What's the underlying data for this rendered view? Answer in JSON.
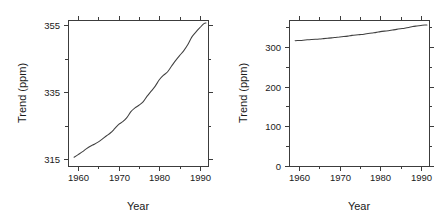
{
  "figure": {
    "title": "",
    "background": "#ffffff",
    "line_color": "#404040",
    "axis_color": "#3c3c3c",
    "panel_count": 2
  },
  "chart_data": [
    {
      "type": "line",
      "panel": "left",
      "title": "",
      "xlabel": "Year",
      "ylabel": "Trend (ppm)",
      "xlim": [
        1957.5,
        1992.0
      ],
      "ylim": [
        313.0,
        356.5
      ],
      "grid": false,
      "legend": null,
      "xticks": [
        1960,
        1970,
        1980,
        1990
      ],
      "xticklabels": [
        "1960",
        "1970",
        "1980",
        "1990"
      ],
      "xminorticks": [
        1965,
        1975,
        1985
      ],
      "yticks": [
        315,
        335,
        355
      ],
      "yticklabels": [
        "315",
        "335",
        "355"
      ],
      "yminorticks": [
        325,
        345
      ],
      "frame": "box",
      "tick_direction": "out",
      "series": [
        {
          "name": "CO2 trend",
          "x": [
            1959.0,
            1960.0,
            1961.0,
            1962.0,
            1963.0,
            1964.0,
            1965.0,
            1966.0,
            1967.0,
            1968.0,
            1969.0,
            1970.0,
            1971.0,
            1972.0,
            1973.0,
            1974.0,
            1975.0,
            1976.0,
            1977.0,
            1978.0,
            1979.0,
            1980.0,
            1981.0,
            1982.0,
            1983.0,
            1984.0,
            1985.0,
            1986.0,
            1987.0,
            1988.0,
            1989.0,
            1990.0,
            1991.0,
            1991.5
          ],
          "y": [
            315.6,
            316.4,
            317.2,
            318.1,
            318.9,
            319.5,
            320.2,
            321.1,
            322.0,
            322.9,
            324.1,
            325.4,
            326.2,
            327.4,
            329.2,
            330.3,
            331.1,
            332.1,
            333.8,
            335.3,
            336.8,
            338.7,
            340.0,
            341.0,
            342.7,
            344.4,
            345.9,
            347.3,
            349.1,
            351.4,
            352.9,
            354.2,
            355.4,
            355.6
          ],
          "color": "#404040"
        }
      ]
    },
    {
      "type": "line",
      "panel": "right",
      "title": "",
      "xlabel": "Year",
      "ylabel": "Trend (ppm)",
      "xlim": [
        1957.5,
        1992.0
      ],
      "ylim": [
        0,
        368
      ],
      "grid": false,
      "legend": null,
      "xticks": [
        1960,
        1970,
        1980,
        1990
      ],
      "xticklabels": [
        "1960",
        "1970",
        "1980",
        "1990"
      ],
      "xminorticks": [
        1965,
        1975,
        1985
      ],
      "yticks": [
        0,
        100,
        200,
        300
      ],
      "yticklabels": [
        "0",
        "100",
        "200",
        "300"
      ],
      "yminorticks": [
        50,
        150,
        250,
        350
      ],
      "frame": "box",
      "tick_direction": "out",
      "series": [
        {
          "name": "CO2 trend",
          "x": [
            1959.0,
            1960.0,
            1961.0,
            1962.0,
            1963.0,
            1964.0,
            1965.0,
            1966.0,
            1967.0,
            1968.0,
            1969.0,
            1970.0,
            1971.0,
            1972.0,
            1973.0,
            1974.0,
            1975.0,
            1976.0,
            1977.0,
            1978.0,
            1979.0,
            1980.0,
            1981.0,
            1982.0,
            1983.0,
            1984.0,
            1985.0,
            1986.0,
            1987.0,
            1988.0,
            1989.0,
            1990.0,
            1991.0,
            1991.5
          ],
          "y": [
            315.6,
            316.4,
            317.2,
            318.1,
            318.9,
            319.5,
            320.2,
            321.1,
            322.0,
            322.9,
            324.1,
            325.4,
            326.2,
            327.4,
            329.2,
            330.3,
            331.1,
            332.1,
            333.8,
            335.3,
            336.8,
            338.7,
            340.0,
            341.0,
            342.7,
            344.4,
            345.9,
            347.3,
            349.1,
            351.4,
            352.9,
            354.2,
            355.4,
            355.6
          ],
          "color": "#404040"
        }
      ]
    }
  ]
}
